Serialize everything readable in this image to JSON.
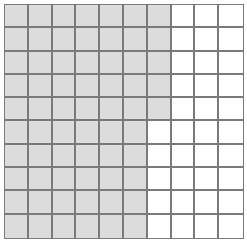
{
  "grid": {
    "rows": 10,
    "cols": 10,
    "shaded_per_row": [
      7,
      7,
      7,
      7,
      7,
      6,
      6,
      6,
      6,
      6
    ],
    "total_shaded": 65,
    "total_cells": 100,
    "colors": {
      "shaded": "#dcdcdc",
      "unshaded": "#ffffff",
      "line": "#7a7a7a"
    }
  }
}
